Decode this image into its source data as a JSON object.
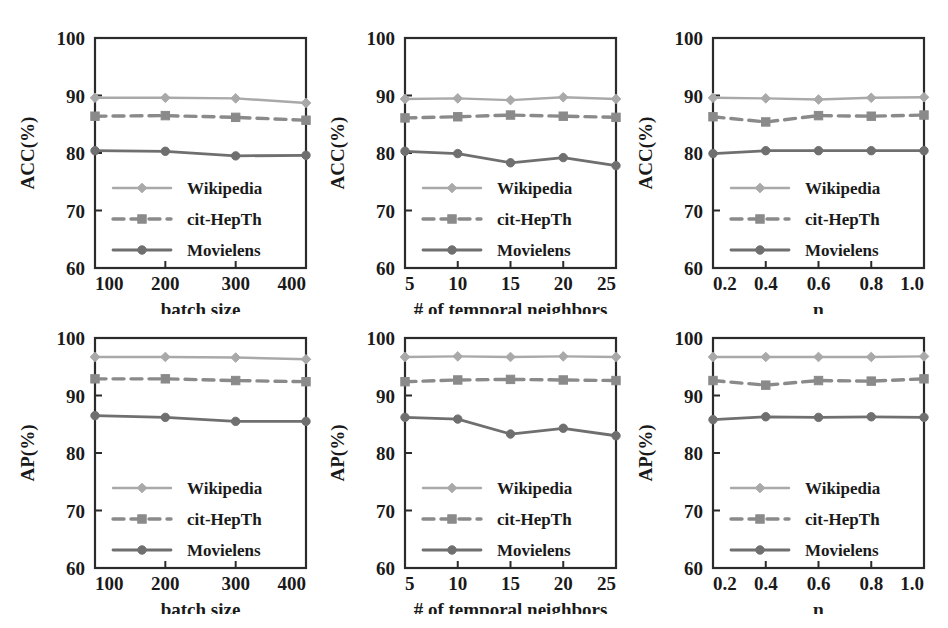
{
  "figure": {
    "series_names": [
      "Wikipedia",
      "cit-HepTh",
      "Movielens"
    ],
    "colors": {
      "wikipedia": "#a9a9a9",
      "cit_hepth": "#8a8a8a",
      "movielens": "#6f6f6f",
      "axis": "#2b2b2b",
      "background": "#ffffff"
    },
    "legend_labels": {
      "wikipedia": "Wikipedia",
      "cit_hepth": "cit-HepTh",
      "movielens": "Movielens"
    },
    "y_ticks": [
      "60",
      "70",
      "80",
      "90",
      "100"
    ]
  },
  "chart_data": [
    {
      "id": "acc-batch-size",
      "type": "line",
      "title": "",
      "xlabel": "batch size",
      "ylabel": "ACC(%)",
      "categories": [
        "100",
        "200",
        "300",
        "400"
      ],
      "xticks": [
        "100",
        "200",
        "300",
        "400"
      ],
      "yticks": [
        60,
        70,
        80,
        90,
        100
      ],
      "ylim": [
        60,
        100
      ],
      "grid": false,
      "legend_position": "lower-left",
      "series": [
        {
          "name": "Wikipedia",
          "values": [
            89.6,
            89.6,
            89.5,
            88.7
          ]
        },
        {
          "name": "cit-HepTh",
          "values": [
            86.4,
            86.5,
            86.2,
            85.7
          ]
        },
        {
          "name": "Movielens",
          "values": [
            80.4,
            80.3,
            79.5,
            79.6
          ]
        }
      ]
    },
    {
      "id": "acc-temporal-neighbors",
      "type": "line",
      "title": "",
      "xlabel": "# of temporal neighbors",
      "ylabel": "ACC(%)",
      "categories": [
        "5",
        "10",
        "15",
        "20",
        "25"
      ],
      "xticks": [
        "5",
        "10",
        "15",
        "20",
        "25"
      ],
      "yticks": [
        60,
        70,
        80,
        90,
        100
      ],
      "ylim": [
        60,
        100
      ],
      "grid": false,
      "legend_position": "lower-left",
      "series": [
        {
          "name": "Wikipedia",
          "values": [
            89.4,
            89.5,
            89.2,
            89.7,
            89.4
          ]
        },
        {
          "name": "cit-HepTh",
          "values": [
            86.1,
            86.3,
            86.6,
            86.4,
            86.2
          ]
        },
        {
          "name": "Movielens",
          "values": [
            80.3,
            79.9,
            78.3,
            79.2,
            77.8
          ]
        }
      ]
    },
    {
      "id": "acc-eta",
      "type": "line",
      "title": "",
      "xlabel": "η",
      "ylabel": "ACC(%)",
      "categories": [
        "0.2",
        "0.4",
        "0.6",
        "0.8",
        "1.0"
      ],
      "xticks": [
        "0.2",
        "0.4",
        "0.6",
        "0.8",
        "1.0"
      ],
      "yticks": [
        60,
        70,
        80,
        90,
        100
      ],
      "ylim": [
        60,
        100
      ],
      "grid": false,
      "legend_position": "lower-left",
      "series": [
        {
          "name": "Wikipedia",
          "values": [
            89.6,
            89.5,
            89.3,
            89.6,
            89.7
          ]
        },
        {
          "name": "cit-HepTh",
          "values": [
            86.3,
            85.4,
            86.5,
            86.4,
            86.6
          ]
        },
        {
          "name": "Movielens",
          "values": [
            79.9,
            80.4,
            80.4,
            80.4,
            80.4
          ]
        }
      ]
    },
    {
      "id": "ap-batch-size",
      "type": "line",
      "title": "",
      "xlabel": "batch size",
      "ylabel": "AP(%)",
      "categories": [
        "100",
        "200",
        "300",
        "400"
      ],
      "xticks": [
        "100",
        "200",
        "300",
        "400"
      ],
      "yticks": [
        60,
        70,
        80,
        90,
        100
      ],
      "ylim": [
        60,
        100
      ],
      "grid": false,
      "legend_position": "lower-left",
      "series": [
        {
          "name": "Wikipedia",
          "values": [
            96.7,
            96.7,
            96.6,
            96.3
          ]
        },
        {
          "name": "cit-HepTh",
          "values": [
            92.9,
            92.9,
            92.6,
            92.4
          ]
        },
        {
          "name": "Movielens",
          "values": [
            86.5,
            86.2,
            85.5,
            85.5
          ]
        }
      ]
    },
    {
      "id": "ap-temporal-neighbors",
      "type": "line",
      "title": "",
      "xlabel": "# of temporal neighbors",
      "ylabel": "AP(%)",
      "categories": [
        "5",
        "10",
        "15",
        "20",
        "25"
      ],
      "xticks": [
        "5",
        "10",
        "15",
        "20",
        "25"
      ],
      "yticks": [
        60,
        70,
        80,
        90,
        100
      ],
      "ylim": [
        60,
        100
      ],
      "grid": false,
      "legend_position": "lower-left",
      "series": [
        {
          "name": "Wikipedia",
          "values": [
            96.7,
            96.8,
            96.7,
            96.8,
            96.7
          ]
        },
        {
          "name": "cit-HepTh",
          "values": [
            92.4,
            92.7,
            92.8,
            92.7,
            92.6
          ]
        },
        {
          "name": "Movielens",
          "values": [
            86.2,
            85.9,
            83.3,
            84.3,
            83.0
          ]
        }
      ]
    },
    {
      "id": "ap-eta",
      "type": "line",
      "title": "",
      "xlabel": "η",
      "ylabel": "AP(%)",
      "categories": [
        "0.2",
        "0.4",
        "0.6",
        "0.8",
        "1.0"
      ],
      "xticks": [
        "0.2",
        "0.4",
        "0.6",
        "0.8",
        "1.0"
      ],
      "yticks": [
        60,
        70,
        80,
        90,
        100
      ],
      "ylim": [
        60,
        100
      ],
      "grid": false,
      "legend_position": "lower-left",
      "series": [
        {
          "name": "Wikipedia",
          "values": [
            96.7,
            96.7,
            96.7,
            96.7,
            96.8
          ]
        },
        {
          "name": "cit-HepTh",
          "values": [
            92.6,
            91.8,
            92.6,
            92.5,
            92.9
          ]
        },
        {
          "name": "Movielens",
          "values": [
            85.8,
            86.3,
            86.2,
            86.3,
            86.2
          ]
        }
      ]
    }
  ]
}
